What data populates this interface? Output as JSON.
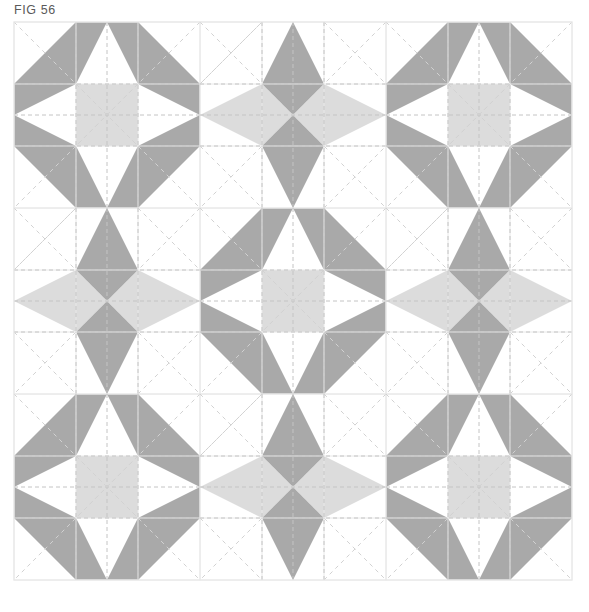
{
  "figure": {
    "label": "FIG 56",
    "title": "FIG 56",
    "kind": "quilt-block-layout-diagram"
  },
  "canvas": {
    "width": 589,
    "height": 612,
    "background": "#ffffff"
  },
  "palette": {
    "background": "#ffffff",
    "patch_dark": "#a9a9a9",
    "patch_light": "#dcdcdc",
    "patch_white": "#ffffff",
    "block_outline": "#e8e8e8",
    "seam_dash": "#c4c4c4",
    "diagonal_dash": "#d2d2d2",
    "caption_text": "#5a5a5a"
  },
  "layout": {
    "origin_x": 14,
    "origin_y": 22,
    "block_size": 186,
    "rows": 3,
    "cols": 3,
    "cells_per_block": 3,
    "grid_on": true,
    "seam_lines": "dashed",
    "diagonal_lines": "dashed"
  },
  "legend": {
    "block_types": [
      {
        "key": "eight-point-star",
        "name": "Eight Point Star",
        "center": "light square",
        "points": 8,
        "point_color": "#a9a9a9",
        "center_color": "#dcdcdc"
      },
      {
        "key": "four-point-diamond-star",
        "name": "Four Point Diamond Star",
        "center": "hourglass pinwheel",
        "points": 4,
        "vertical_point_color": "#a9a9a9",
        "horizontal_point_color": "#dcdcdc"
      }
    ]
  },
  "blocks": [
    {
      "row": 0,
      "col": 0,
      "type": "eight-point-star",
      "name": "block-r1c1"
    },
    {
      "row": 0,
      "col": 1,
      "type": "four-point-diamond-star",
      "name": "block-r1c2"
    },
    {
      "row": 0,
      "col": 2,
      "type": "eight-point-star",
      "name": "block-r1c3"
    },
    {
      "row": 1,
      "col": 0,
      "type": "four-point-diamond-star",
      "name": "block-r2c1"
    },
    {
      "row": 1,
      "col": 1,
      "type": "eight-point-star",
      "name": "block-r2c2"
    },
    {
      "row": 1,
      "col": 2,
      "type": "four-point-diamond-star",
      "name": "block-r2c3"
    },
    {
      "row": 2,
      "col": 0,
      "type": "eight-point-star",
      "name": "block-r3c1"
    },
    {
      "row": 2,
      "col": 1,
      "type": "four-point-diamond-star",
      "name": "block-r3c2"
    },
    {
      "row": 2,
      "col": 2,
      "type": "eight-point-star",
      "name": "block-r3c3"
    }
  ]
}
